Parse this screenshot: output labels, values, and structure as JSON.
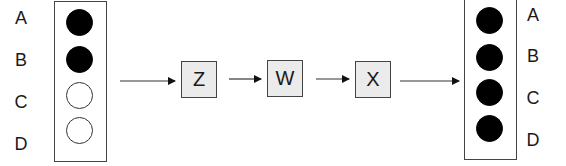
{
  "input_state": {
    "labels": [
      "A",
      "B",
      "C",
      "D"
    ],
    "bits": [
      {
        "label": "A",
        "state": "filled"
      },
      {
        "label": "B",
        "state": "filled"
      },
      {
        "label": "C",
        "state": "empty"
      },
      {
        "label": "D",
        "state": "empty"
      }
    ]
  },
  "steps": [
    {
      "label": "Z"
    },
    {
      "label": "W"
    },
    {
      "label": "X"
    }
  ],
  "output_state": {
    "labels": [
      "A",
      "B",
      "C",
      "D"
    ],
    "bits": [
      {
        "label": "A",
        "state": "filled"
      },
      {
        "label": "B",
        "state": "filled"
      },
      {
        "label": "C",
        "state": "filled"
      },
      {
        "label": "D",
        "state": "filled"
      }
    ]
  },
  "colors": {
    "filled": "#000000",
    "step_fill": "#ebebeb",
    "stroke": "#444444"
  }
}
